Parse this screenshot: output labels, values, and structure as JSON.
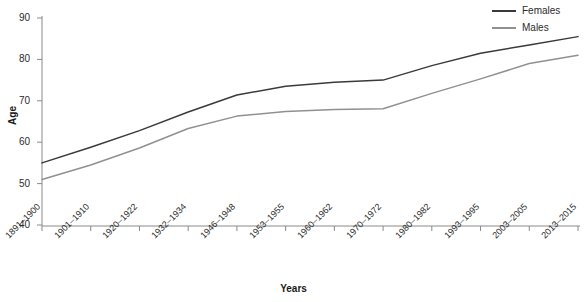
{
  "chart_data": {
    "type": "line",
    "title": "",
    "xlabel": "Years",
    "ylabel": "Age",
    "ylim": [
      40,
      90
    ],
    "yticks": [
      40,
      50,
      60,
      70,
      80,
      90
    ],
    "grid": false,
    "legend_position": "top-right",
    "categories": [
      "1891–1900",
      "1901–1910",
      "1920–1922",
      "1932–1934",
      "1946–1948",
      "1953–1955",
      "1960–1962",
      "1970–1972",
      "1980–1982",
      "1993–1995",
      "2003–2005",
      "2013–2015"
    ],
    "series": [
      {
        "name": "Females",
        "color": "#3a3a3a",
        "values": [
          55.0,
          58.8,
          62.8,
          67.3,
          71.4,
          73.5,
          74.5,
          75.0,
          78.5,
          81.5,
          83.5,
          85.5
        ]
      },
      {
        "name": "Males",
        "color": "#909090",
        "values": [
          51.0,
          54.5,
          58.6,
          63.3,
          66.3,
          67.4,
          67.9,
          68.1,
          71.8,
          75.3,
          79.0,
          81.0
        ]
      }
    ]
  },
  "axis": {
    "y_title": "Age",
    "x_title": "Years"
  },
  "legend": {
    "items": [
      {
        "label": "Females",
        "color": "#3a3a3a"
      },
      {
        "label": "Males",
        "color": "#909090"
      }
    ]
  }
}
